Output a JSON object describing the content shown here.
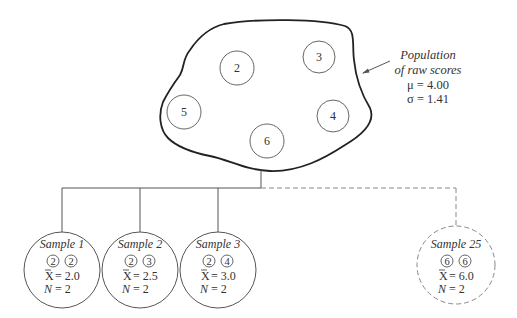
{
  "population": {
    "label_line1": "Population",
    "label_line2": "of raw scores",
    "mu": "μ = 4.00",
    "sigma": "σ = 1.41",
    "scores": [
      "2",
      "3",
      "5",
      "4",
      "6"
    ]
  },
  "samples": [
    {
      "title": "Sample 1",
      "scores": [
        "2",
        "2"
      ],
      "mean_symbol": "X",
      "mean_value": "= 2.0",
      "n_symbol": "N",
      "n_value": "= 2",
      "style": "solid"
    },
    {
      "title": "Sample 2",
      "scores": [
        "2",
        "3"
      ],
      "mean_symbol": "X",
      "mean_value": "= 2.5",
      "n_symbol": "N",
      "n_value": "= 2",
      "style": "solid"
    },
    {
      "title": "Sample 3",
      "scores": [
        "2",
        "4"
      ],
      "mean_symbol": "X",
      "mean_value": "= 3.0",
      "n_symbol": "N",
      "n_value": "= 2",
      "style": "solid"
    },
    {
      "title": "Sample 25",
      "scores": [
        "6",
        "6"
      ],
      "mean_symbol": "X",
      "mean_value": "= 6.0",
      "n_symbol": "N",
      "n_value": "= 2",
      "style": "dashed"
    }
  ],
  "colors": {
    "line": "#555555",
    "blob": "#222222",
    "text": "#333333",
    "dashed": "#888888"
  }
}
